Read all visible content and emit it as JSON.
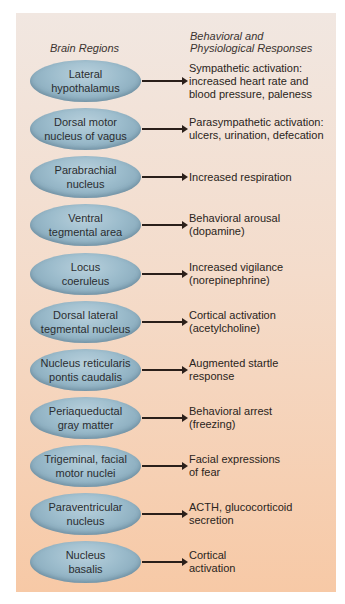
{
  "headers": {
    "left": "Brain Regions",
    "right": "Behavioral and\nPhysiological Responses"
  },
  "rows": [
    {
      "region": "Lateral\nhypothalamus",
      "response": "Sympathetic activation:\nincreased heart rate and\nblood pressure, paleness"
    },
    {
      "region": "Dorsal motor\nnucleus of vagus",
      "response": "Parasympathetic activation:\nulcers, urination, defecation"
    },
    {
      "region": "Parabrachial\nnucleus",
      "response": "Increased respiration"
    },
    {
      "region": "Ventral\ntegmental area",
      "response": "Behavioral arousal\n(dopamine)"
    },
    {
      "region": "Locus\ncoeruleus",
      "response": "Increased vigilance\n(norepinephrine)"
    },
    {
      "region": "Dorsal lateral\ntegmental nucleus",
      "response": "Cortical activation\n(acetylcholine)"
    },
    {
      "region": "Nucleus reticularis\npontis caudalis",
      "response": "Augmented startle\nresponse"
    },
    {
      "region": "Periaqueductal\ngray matter",
      "response": "Behavioral arrest\n(freezing)"
    },
    {
      "region": "Trigeminal, facial\nmotor nuclei",
      "response": "Facial expressions\nof fear"
    },
    {
      "region": "Paraventricular\nnucleus",
      "response": "ACTH, glucocorticoid\nsecretion"
    },
    {
      "region": "Nucleus\nbasalis",
      "response": "Cortical\nactivation"
    }
  ],
  "colors": {
    "panel_top": "#f1e7e1",
    "panel_bottom": "#f7c9a6",
    "ellipse": "#9cbccc",
    "arrow": "#2a1f1a"
  }
}
